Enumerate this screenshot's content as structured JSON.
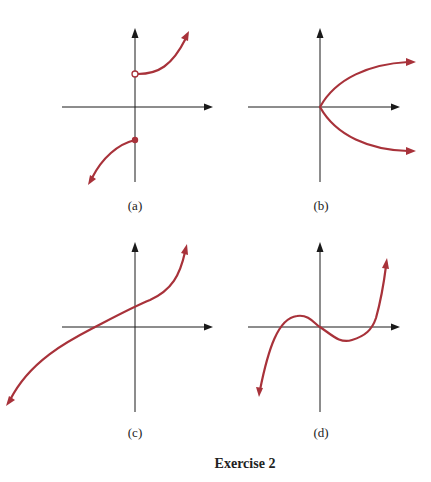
{
  "figure": {
    "caption": "Exercise 2",
    "curve_color": "#a8323a",
    "axis_color": "#1a1a1a",
    "panels": [
      {
        "id": "a",
        "label": "(a)",
        "description": "Discontinuous increasing curve: open circle on positive y-axis, closed dot on negative y-axis"
      },
      {
        "id": "b",
        "label": "(b)",
        "description": "Sideways parabola opening right, vertex at origin"
      },
      {
        "id": "c",
        "label": "(c)",
        "description": "Increasing cubic-like curve crossing negative x-axis and positive y-axis"
      },
      {
        "id": "d",
        "label": "(d)",
        "description": "Cubic curve through origin with local max left and local min right"
      }
    ]
  }
}
